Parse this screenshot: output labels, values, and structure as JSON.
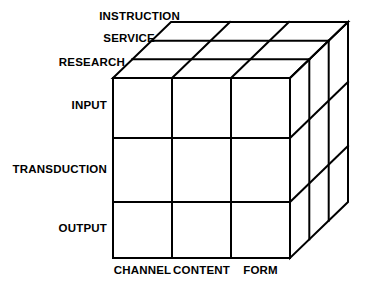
{
  "figure": {
    "background_color": "#ffffff",
    "line_color": "#000000",
    "text_color": "#000000"
  },
  "axes": {
    "depth_axis": {
      "name": "purpose",
      "labels": [
        "INSTRUCTION",
        "SERVICE",
        "RESEARCH"
      ]
    },
    "vertical_axis": {
      "name": "process",
      "labels": [
        "INPUT",
        "TRANSDUCTION",
        "OUTPUT"
      ]
    },
    "horizontal_axis": {
      "name": "dimension",
      "labels": [
        "CHANNEL",
        "CONTENT",
        "FORM"
      ]
    }
  },
  "labels": {
    "instruction": "INSTRUCTION",
    "service": "SERVICE",
    "research": "RESEARCH",
    "input": "INPUT",
    "transduction": "TRANSDUCTION",
    "output": "OUTPUT",
    "channel": "CHANNEL",
    "content": "CONTENT",
    "form": "FORM"
  },
  "geometry": {
    "front_face": {
      "left": 113,
      "top": 78,
      "right": 290,
      "bottom": 258
    },
    "depth_vector": {
      "dx": 58,
      "dy": -56
    },
    "columns": 3,
    "rows": 3,
    "slabs": 3,
    "column_x": [
      113,
      172,
      231,
      290
    ],
    "row_y": [
      78,
      138,
      202,
      258
    ],
    "stroke_width": 2
  }
}
